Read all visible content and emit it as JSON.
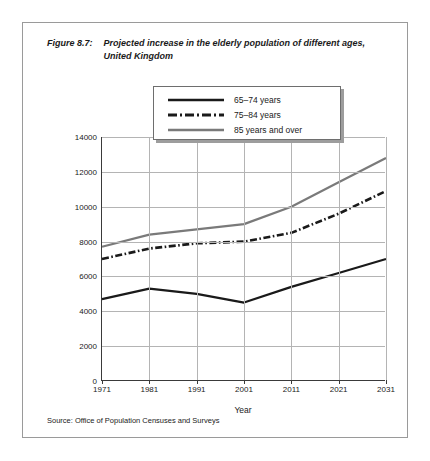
{
  "figure": {
    "number_label": "Figure 8.7:",
    "title": "Projected increase in the elderly population of different ages, United Kingdom",
    "source": "Source: Office of Population Censuses and Surveys"
  },
  "legend": {
    "items": [
      {
        "label": "65–74 years",
        "style": "solid",
        "color": "#1a1a1a"
      },
      {
        "label": "75–84 years",
        "style": "dash-dot",
        "color": "#1a1a1a"
      },
      {
        "label": "85 years and over",
        "style": "solid",
        "color": "#7a7a7a"
      }
    ]
  },
  "chart_data": {
    "type": "line",
    "title": "Projected increase in the elderly population of different ages, United Kingdom",
    "xlabel": "Year",
    "ylabel": "Population in thousands",
    "x": [
      1971,
      1981,
      1991,
      2001,
      2011,
      2021,
      2031
    ],
    "xticklabels": [
      "1971",
      "1981",
      "1991",
      "2001",
      "2011",
      "2021",
      "2031"
    ],
    "yticklabels": [
      "0",
      "2000",
      "4000",
      "6000",
      "8000",
      "10000",
      "12000",
      "14000"
    ],
    "yticks": [
      0,
      2000,
      4000,
      6000,
      8000,
      10000,
      12000,
      14000
    ],
    "ylim": [
      0,
      14000
    ],
    "grid": true,
    "legend_position": "upper center",
    "series": [
      {
        "name": "65–74 years",
        "color": "#1a1a1a",
        "style": "solid",
        "values": [
          4700,
          5300,
          5000,
          4500,
          5400,
          6200,
          7000
        ]
      },
      {
        "name": "75–84 years",
        "color": "#1a1a1a",
        "style": "dash-dot",
        "values": [
          7000,
          7600,
          7900,
          8000,
          8500,
          9600,
          10900
        ]
      },
      {
        "name": "85 years and over",
        "color": "#7a7a7a",
        "style": "solid",
        "values": [
          7700,
          8400,
          8700,
          9000,
          10000,
          11400,
          12800
        ]
      }
    ]
  }
}
